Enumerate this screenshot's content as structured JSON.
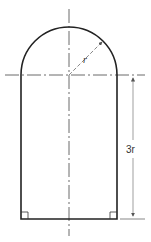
{
  "diagram": {
    "labels": {
      "radius": "r",
      "height": "3r"
    },
    "colors": {
      "outline": "#222222",
      "centerline": "#444444",
      "dimension": "#555555",
      "background": "#ffffff"
    }
  }
}
